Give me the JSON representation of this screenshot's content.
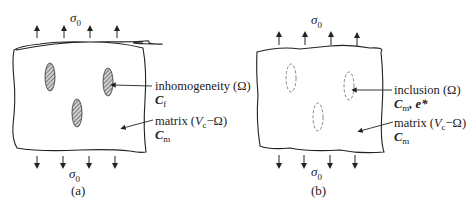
{
  "panels": [
    {
      "id": "a",
      "caption": "(a)",
      "top_load": {
        "symbol": "σ",
        "sub": "0",
        "arrows": 4,
        "direction": "up"
      },
      "bottom_load": {
        "symbol": "σ",
        "sub": "0",
        "arrows": 4,
        "direction": "down"
      },
      "region_style": "hatched-solid",
      "label1": {
        "text": "inhomogeneity (Ω)",
        "prop": "C",
        "prop_sub": "f",
        "prop_extra": ""
      },
      "label2": {
        "text_pre": "matrix (",
        "V": "V",
        "V_sub": "c",
        "text_post": "−Ω)",
        "prop": "C",
        "prop_sub": "m"
      }
    },
    {
      "id": "b",
      "caption": "(b)",
      "top_load": {
        "symbol": "σ",
        "sub": "0",
        "arrows": 4,
        "direction": "up"
      },
      "bottom_load": {
        "symbol": "σ",
        "sub": "0",
        "arrows": 4,
        "direction": "down"
      },
      "region_style": "dashed-outline",
      "label1": {
        "text": "inclusion (Ω)",
        "prop": "C",
        "prop_sub": "m",
        "prop_extra": ", e*"
      },
      "label2": {
        "text_pre": "matrix (",
        "V": "V",
        "V_sub": "c",
        "text_post": "−Ω)",
        "prop": "C",
        "prop_sub": "m"
      }
    }
  ],
  "colors": {
    "ink": "#222222",
    "hatch": "#555555",
    "dash": "#777777"
  }
}
